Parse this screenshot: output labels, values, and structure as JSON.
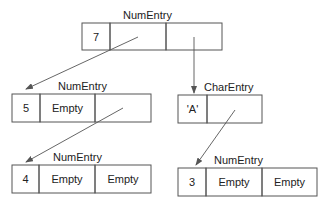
{
  "diagram": {
    "title": "",
    "nodes": [
      {
        "id": "n7",
        "type": "NumEntry",
        "label": "NumEntry",
        "cells": [
          "7",
          "",
          ""
        ]
      },
      {
        "id": "n5",
        "type": "NumEntry",
        "label": "NumEntry",
        "cells": [
          "5",
          "Empty",
          ""
        ]
      },
      {
        "id": "cA",
        "type": "CharEntry",
        "label": "CharEntry",
        "cells": [
          "'A'",
          ""
        ]
      },
      {
        "id": "n4",
        "type": "NumEntry",
        "label": "NumEntry",
        "cells": [
          "4",
          "Empty",
          "Empty"
        ]
      },
      {
        "id": "n3",
        "type": "NumEntry",
        "label": "NumEntry",
        "cells": [
          "3",
          "Empty",
          "Empty"
        ]
      }
    ],
    "edges": [
      {
        "from": "n7",
        "from_cell": 1,
        "to": "n5"
      },
      {
        "from": "n7",
        "from_cell": 2,
        "to": "cA"
      },
      {
        "from": "n5",
        "from_cell": 2,
        "to": "n4"
      },
      {
        "from": "cA",
        "from_cell": 1,
        "to": "n3"
      }
    ]
  }
}
